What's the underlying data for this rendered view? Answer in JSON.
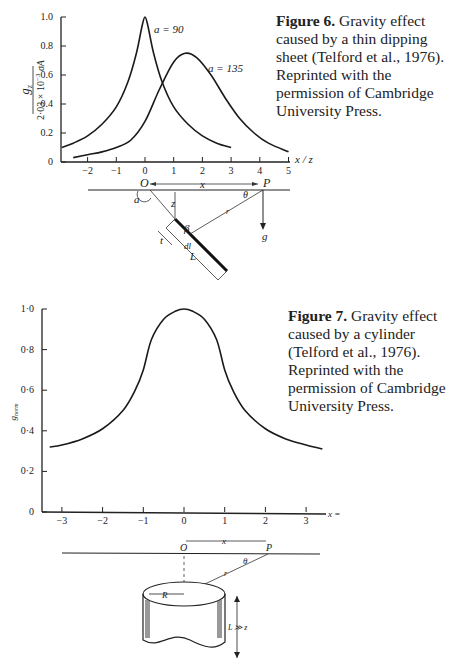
{
  "figure6": {
    "caption_label": "Figure 6.",
    "caption_text": " Gravity effect caused by a thin dipping sheet (Telford et al., 1976). Reprinted with the permission of Cambridge University Press.",
    "diagram": {
      "labels": {
        "origin": "O",
        "point": "P",
        "distance": "x",
        "depth": "z",
        "angle_alpha": "a",
        "angle_theta": "θ",
        "angle_beta": "β",
        "range": "r",
        "element": "dl",
        "thickness": "t",
        "length": "L",
        "gravity": "g"
      }
    }
  },
  "figure7": {
    "caption_label": "Figure 7.",
    "caption_text": " Gravity effect caused by a cylinder (Telford et al., 1976). Reprinted with the permission of Cambridge University Press.",
    "diagram": {
      "labels": {
        "origin": "O",
        "point": "P",
        "distance": "x",
        "range": "r",
        "angle_theta": "θ",
        "radius": "R",
        "length": "L ≫ z"
      }
    }
  },
  "chart_data": [
    {
      "type": "line",
      "title": "",
      "xlabel": "x / z",
      "ylabel": "g_z / (2·03 × 10⁻³ σA)",
      "xlim": [
        -2.9,
        5
      ],
      "ylim": [
        0,
        1.0
      ],
      "x_ticks": [
        -2,
        -1,
        0,
        1,
        2,
        3,
        4,
        5
      ],
      "x_tick_labels": [
        "−2",
        "−1",
        "0",
        "1",
        "2",
        "3",
        "4",
        "5"
      ],
      "y_ticks": [
        0,
        0.2,
        0.4,
        0.6,
        0.8,
        1.0
      ],
      "y_tick_labels": [
        "0",
        "0.2",
        "0.4",
        "0.6",
        "0.8",
        "1.0"
      ],
      "grid": false,
      "series": [
        {
          "name": "a = 90",
          "x": [
            -2.9,
            -2.5,
            -2,
            -1.5,
            -1,
            -0.6,
            -0.3,
            -0.1,
            0,
            0.1,
            0.3,
            0.6,
            1,
            1.5,
            2,
            2.5,
            3
          ],
          "y": [
            0.1,
            0.13,
            0.18,
            0.26,
            0.38,
            0.55,
            0.75,
            0.94,
            1.0,
            0.94,
            0.75,
            0.55,
            0.38,
            0.26,
            0.18,
            0.13,
            0.1
          ]
        },
        {
          "name": "a = 135",
          "x": [
            -2.5,
            -2,
            -1.5,
            -1,
            -0.5,
            0,
            0.5,
            1,
            1.4,
            1.8,
            2.3,
            2.8,
            3.3,
            3.8,
            4.3,
            5
          ],
          "y": [
            0.03,
            0.05,
            0.07,
            0.1,
            0.15,
            0.28,
            0.5,
            0.69,
            0.75,
            0.72,
            0.6,
            0.44,
            0.3,
            0.2,
            0.13,
            0.07
          ]
        }
      ],
      "annotations": [
        "a = 90",
        "a = 135"
      ]
    },
    {
      "type": "line",
      "title": "",
      "xlabel": "x =",
      "ylabel": "g_norm",
      "xlim": [
        -3.5,
        3.5
      ],
      "ylim": [
        0,
        1.0
      ],
      "x_ticks": [
        -3,
        -2,
        -1,
        0,
        1,
        2,
        3
      ],
      "x_tick_labels": [
        "−3",
        "−2",
        "−1",
        "0",
        "1",
        "2",
        "3"
      ],
      "y_ticks": [
        0,
        0.2,
        0.4,
        0.6,
        0.8,
        1.0
      ],
      "y_tick_labels": [
        "0",
        "0·2",
        "0·4",
        "0·6",
        "0·8",
        "1·0"
      ],
      "grid": false,
      "series": [
        {
          "name": "g_norm",
          "x": [
            -3.3,
            -3,
            -2.5,
            -2,
            -1.5,
            -1.2,
            -1,
            -0.8,
            -0.5,
            -0.2,
            0,
            0.2,
            0.5,
            0.8,
            1,
            1.2,
            1.5,
            2,
            2.5,
            3,
            3.4
          ],
          "y": [
            0.32,
            0.33,
            0.36,
            0.41,
            0.5,
            0.6,
            0.7,
            0.85,
            0.95,
            0.99,
            1.0,
            0.99,
            0.95,
            0.85,
            0.7,
            0.6,
            0.5,
            0.41,
            0.36,
            0.33,
            0.31
          ]
        }
      ]
    }
  ]
}
